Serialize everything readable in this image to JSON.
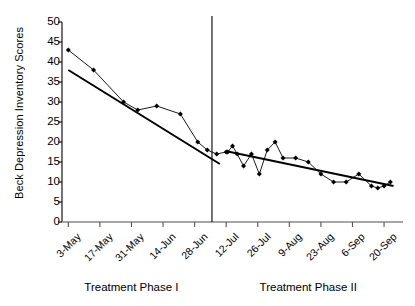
{
  "chart_data": {
    "type": "line",
    "title": "",
    "subtitle": "",
    "xlabel": "",
    "ylabel": "Beck Depression Inventory Scores",
    "ylim": [
      0,
      50
    ],
    "ytick_labels": [
      "0",
      "5",
      "10",
      "15",
      "20",
      "25",
      "30",
      "35",
      "40",
      "45",
      "50"
    ],
    "ytick_values": [
      0,
      5,
      10,
      15,
      20,
      25,
      30,
      35,
      40,
      45,
      50
    ],
    "grid": false,
    "legend": "none",
    "xtick_labels": [
      "3-May",
      "17-May",
      "31-May",
      "14-Jun",
      "28-Jun",
      "12-Jul",
      "26-Jul",
      "9-Aug",
      "23-Aug",
      "6-Sep",
      "20-Sep"
    ],
    "xtick_positions": [
      0,
      2,
      4,
      6,
      8,
      10,
      12,
      14,
      16,
      18,
      20
    ],
    "xlim": [
      -0.4,
      21.2
    ],
    "phase_divider_x": 9.1,
    "annotations": [
      {
        "text": "Treatment Phase I",
        "x_center": 4.0
      },
      {
        "text": "Treatment Phase II",
        "x_center": 15.2
      }
    ],
    "series": [
      {
        "name": "Phase I BDI scores",
        "marker": "diamond",
        "color": "#000000",
        "x": [
          0,
          1.6,
          3.5,
          4.4,
          5.6,
          7.1,
          8.2,
          8.8,
          9.4,
          10.0
        ],
        "values": [
          43,
          38,
          30,
          28,
          29,
          27,
          20,
          18,
          17,
          17.5
        ]
      },
      {
        "name": "Phase I linear trend",
        "marker": "none",
        "color": "#000000",
        "x": [
          0,
          9.6
        ],
        "values": [
          38,
          14.5
        ]
      },
      {
        "name": "Phase II BDI scores",
        "marker": "diamond",
        "color": "#000000",
        "x": [
          10.1,
          10.4,
          10.7,
          11.1,
          11.6,
          12.1,
          12.6,
          13.1,
          13.6,
          14.4,
          15.2,
          16.0,
          16.8,
          17.6,
          18.4,
          19.2,
          19.6,
          20.0,
          20.4
        ],
        "values": [
          17.5,
          19,
          17,
          14,
          17,
          12,
          18,
          20,
          16,
          16,
          15,
          12,
          10,
          10,
          12,
          9,
          8.5,
          9,
          10
        ]
      },
      {
        "name": "Phase II linear trend",
        "marker": "none",
        "color": "#000000",
        "x": [
          10.1,
          20.6
        ],
        "values": [
          17.6,
          9.0
        ]
      }
    ]
  },
  "axis": {
    "y_axis_name": "y-axis",
    "x_axis_name": "x-axis"
  }
}
